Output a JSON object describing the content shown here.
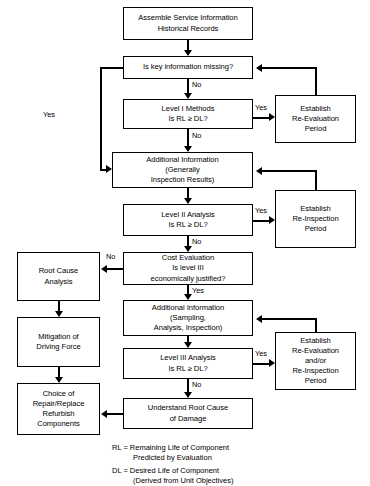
{
  "diagram": {
    "nodes": {
      "assemble": "Assemble Service Information\nHistorical Records",
      "key_info": "Is key information missing?",
      "level1": "Level I Methods\nIs RL ≥ DL?",
      "addl_info_1": "Additional Information\n(Generally\nInspection Results)",
      "level2": "Level II Analysis\nIs RL ≥ DL?",
      "cost_eval": "Cost Evaluation\nIs level III\neconomically justified?",
      "addl_info_2": "Additional Information\n(Sampling,\nAnalysis, Inspection)",
      "level3": "Level III Analysis\nIs RL ≥ DL?",
      "understand": "Understand Root Cause\nof Damage",
      "establish_reeval": "Establish\nRe-Evaluation\nPeriod",
      "establish_reinsp": "Establish\nRe-Inspection\nPeriod",
      "establish_both": "Establish\nRe-Evaluation\nand/or\nRe-Inspection\nPeriod",
      "root_cause": "Root Cause\nAnalysis",
      "mitigation": "Mitigation of\nDriving Force",
      "choice": "Choice of\nRepair/Replace\nRefurbish\nComponents"
    },
    "edge_labels": {
      "key_info_no": "No",
      "key_info_yes": "Yes",
      "level1_no": "No",
      "level1_yes": "Yes",
      "level2_no": "No",
      "level2_yes": "Yes",
      "cost_no": "No",
      "cost_yes": "Yes",
      "level3_no": "No",
      "level3_yes": "Yes"
    },
    "legend": {
      "rl_line1": "RL = Remaining Life of Component",
      "rl_line2": "Predicted by Evaluation",
      "dl_line1": "DL = Desired Life of Component",
      "dl_line2": "(Derived from Unit Objectives)"
    },
    "colors": {
      "line": "#000000",
      "box_fill": "#ffffff",
      "text": "#000000"
    }
  }
}
